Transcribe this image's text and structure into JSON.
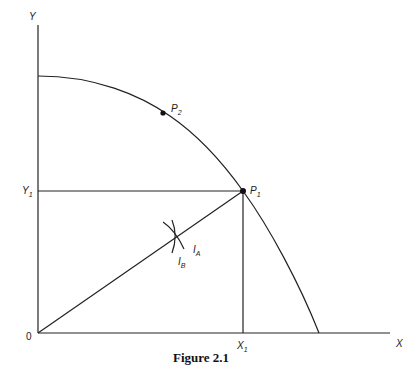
{
  "figure": {
    "caption": "Figure 2.1",
    "axes": {
      "x_label": "X",
      "y_label": "Y",
      "origin_label": "0"
    },
    "markers": {
      "x1": {
        "main": "X",
        "sub": "1"
      },
      "y1": {
        "main": "Y",
        "sub": "1"
      }
    },
    "points": [
      {
        "id": "P1",
        "main": "P",
        "sub": "1"
      },
      {
        "id": "P2",
        "main": "P",
        "sub": "2"
      }
    ],
    "curves": [
      {
        "id": "IA",
        "main": "I",
        "sub": "A"
      },
      {
        "id": "IB",
        "main": "I",
        "sub": "B"
      }
    ],
    "elements": [
      "production-possibility-frontier",
      "ray-from-origin-to-P1",
      "horizontal-line-Y1-to-P1",
      "vertical-line-X1-to-P1",
      "indifference-curve-IA",
      "indifference-curve-IB"
    ]
  }
}
